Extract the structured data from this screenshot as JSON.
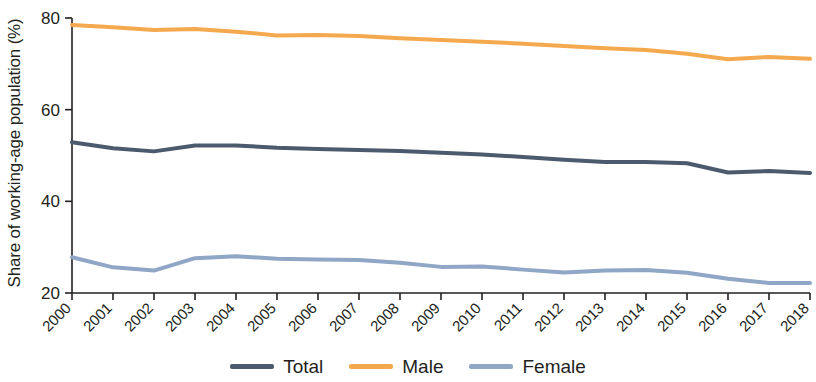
{
  "chart_data": {
    "type": "line",
    "title": "",
    "xlabel": "",
    "ylabel": "Share of working-age population (%)",
    "categories": [
      "2000",
      "2001",
      "2002",
      "2003",
      "2004",
      "2005",
      "2006",
      "2007",
      "2008",
      "2009",
      "2010",
      "2011",
      "2012",
      "2013",
      "2014",
      "2015",
      "2016",
      "2017",
      "2018"
    ],
    "x": [
      2000,
      2001,
      2002,
      2003,
      2004,
      2005,
      2006,
      2007,
      2008,
      2009,
      2010,
      2011,
      2012,
      2013,
      2014,
      2015,
      2016,
      2017,
      2018
    ],
    "xlim": [
      2000,
      2018
    ],
    "ylim": [
      20,
      80
    ],
    "yticks": [
      20,
      40,
      60,
      80
    ],
    "grid": false,
    "legend_position": "bottom",
    "series": [
      {
        "name": "Total",
        "color": "#4c5a6e",
        "values": [
          52.9,
          51.6,
          50.9,
          52.2,
          52.2,
          51.7,
          51.4,
          51.2,
          51.0,
          50.6,
          50.2,
          49.7,
          49.1,
          48.6,
          48.6,
          48.3,
          46.3,
          46.6,
          46.2
        ]
      },
      {
        "name": "Male",
        "color": "#f5a94e",
        "values": [
          78.5,
          78.0,
          77.4,
          77.6,
          77.0,
          76.2,
          76.3,
          76.1,
          75.6,
          75.2,
          74.8,
          74.4,
          73.9,
          73.4,
          73.0,
          72.2,
          71.0,
          71.5,
          71.1
        ]
      },
      {
        "name": "Female",
        "color": "#8fa6c6",
        "values": [
          27.8,
          25.6,
          24.9,
          27.6,
          28.0,
          27.5,
          27.3,
          27.2,
          26.6,
          25.7,
          25.8,
          25.1,
          24.5,
          24.9,
          25.0,
          24.4,
          23.1,
          22.2,
          22.2
        ]
      }
    ]
  },
  "axis": {
    "y_title": "Share of working-age population (%)",
    "y_tick_labels": [
      "20",
      "40",
      "60",
      "80"
    ],
    "x_tick_labels": [
      "2000",
      "2001",
      "2002",
      "2003",
      "2004",
      "2005",
      "2006",
      "2007",
      "2008",
      "2009",
      "2010",
      "2011",
      "2012",
      "2013",
      "2014",
      "2015",
      "2016",
      "2017",
      "2018"
    ]
  },
  "legend": {
    "items": [
      {
        "label": "Total",
        "color": "#4c5a6e"
      },
      {
        "label": "Male",
        "color": "#f5a94e"
      },
      {
        "label": "Female",
        "color": "#8fa6c6"
      }
    ]
  }
}
